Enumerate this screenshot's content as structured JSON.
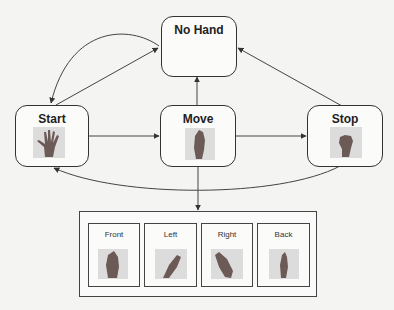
{
  "diagram": {
    "type": "state-machine",
    "states": {
      "no_hand": {
        "label": "No Hand",
        "icon": "none"
      },
      "start": {
        "label": "Start",
        "icon": "open-hand-icon"
      },
      "move": {
        "label": "Move",
        "icon": "upright-hand-icon"
      },
      "stop": {
        "label": "Stop",
        "icon": "fist-icon"
      }
    },
    "orientations": [
      {
        "label": "Front",
        "icon": "hand-front-icon"
      },
      {
        "label": "Left",
        "icon": "hand-left-icon"
      },
      {
        "label": "Right",
        "icon": "hand-right-icon"
      },
      {
        "label": "Back",
        "icon": "hand-back-icon"
      }
    ],
    "transitions": [
      {
        "from": "No Hand",
        "to": "Start",
        "shape": "curved"
      },
      {
        "from": "Start",
        "to": "No Hand",
        "shape": "straight"
      },
      {
        "from": "Move",
        "to": "No Hand",
        "shape": "straight"
      },
      {
        "from": "Stop",
        "to": "No Hand",
        "shape": "straight"
      },
      {
        "from": "Start",
        "to": "Move",
        "shape": "straight"
      },
      {
        "from": "Move",
        "to": "Stop",
        "shape": "straight"
      },
      {
        "from": "Stop",
        "to": "Start",
        "shape": "curved"
      },
      {
        "from": "Move",
        "to": "Orientations",
        "shape": "straight"
      }
    ],
    "colors": {
      "line": "#333333",
      "box_border": "#333333",
      "background": "#f4f4f2",
      "image_bg": "#dcdcdc",
      "hand": "#6b5a55"
    }
  }
}
